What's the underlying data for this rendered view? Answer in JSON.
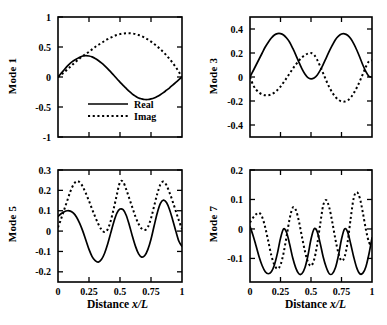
{
  "figure": {
    "background": "#ffffff",
    "ink": "#000000",
    "panel_count": 4
  },
  "legend": {
    "real_label": "Real",
    "imag_label": "Imag",
    "real_style": "solid",
    "imag_style": "dotted",
    "panel": "Mode 1"
  },
  "axes": {
    "xlabel_prefix": "Distance ",
    "xlabel_italic": "x/L",
    "xticks": [
      "0",
      "0.25",
      "0.5",
      "0.75",
      "1"
    ],
    "xtick_values": [
      0,
      0.25,
      0.5,
      0.75,
      1
    ]
  },
  "chart_data": [
    {
      "type": "line",
      "title": "Mode 1",
      "ylabel": "Mode 1",
      "xlabel": "",
      "xlim": [
        0,
        1
      ],
      "ylim": [
        -1,
        1
      ],
      "xticks": [
        0,
        0.25,
        0.5,
        0.75,
        1
      ],
      "xticklabels": [
        "",
        "",
        "",
        "",
        ""
      ],
      "yticks": [
        -1,
        -0.5,
        0,
        0.5,
        1
      ],
      "yticklabels": [
        "-1",
        "-0.5",
        "0",
        "0.5",
        "1"
      ],
      "grid": false,
      "legend": [
        "Real",
        "Imag"
      ],
      "legend_position": "lower center",
      "x": [
        0,
        0.025,
        0.05,
        0.075,
        0.1,
        0.125,
        0.15,
        0.175,
        0.2,
        0.225,
        0.25,
        0.275,
        0.3,
        0.325,
        0.35,
        0.375,
        0.4,
        0.425,
        0.45,
        0.475,
        0.5,
        0.525,
        0.55,
        0.575,
        0.6,
        0.625,
        0.65,
        0.675,
        0.7,
        0.725,
        0.75,
        0.775,
        0.8,
        0.825,
        0.85,
        0.875,
        0.9,
        0.925,
        0.95,
        0.975,
        1
      ],
      "series": [
        {
          "name": "Real",
          "style": "solid",
          "values": [
            0.0,
            0.06,
            0.12,
            0.18,
            0.23,
            0.27,
            0.3,
            0.33,
            0.35,
            0.355,
            0.35,
            0.335,
            0.31,
            0.275,
            0.235,
            0.19,
            0.14,
            0.085,
            0.03,
            -0.03,
            -0.085,
            -0.14,
            -0.19,
            -0.24,
            -0.285,
            -0.32,
            -0.35,
            -0.365,
            -0.375,
            -0.375,
            -0.365,
            -0.35,
            -0.325,
            -0.295,
            -0.26,
            -0.22,
            -0.18,
            -0.135,
            -0.09,
            -0.045,
            0.0
          ]
        },
        {
          "name": "Imag",
          "style": "dotted",
          "values": [
            0.0,
            0.04,
            0.08,
            0.125,
            0.17,
            0.22,
            0.265,
            0.31,
            0.35,
            0.385,
            0.42,
            0.46,
            0.5,
            0.535,
            0.565,
            0.6,
            0.63,
            0.655,
            0.68,
            0.7,
            0.715,
            0.725,
            0.73,
            0.73,
            0.725,
            0.715,
            0.7,
            0.68,
            0.655,
            0.625,
            0.59,
            0.55,
            0.51,
            0.465,
            0.415,
            0.36,
            0.3,
            0.235,
            0.165,
            0.085,
            0.0
          ]
        }
      ]
    },
    {
      "type": "line",
      "title": "Mode 3",
      "ylabel": "Mode 3",
      "xlabel": "",
      "xlim": [
        0,
        1
      ],
      "ylim": [
        -0.5,
        0.5
      ],
      "xticks": [
        0,
        0.25,
        0.5,
        0.75,
        1
      ],
      "xticklabels": [
        "",
        "",
        "",
        "",
        ""
      ],
      "yticks": [
        -0.4,
        -0.2,
        0,
        0.2,
        0.4
      ],
      "yticklabels": [
        "-0.4",
        "-0.2",
        "0",
        "0.2",
        "0.4"
      ],
      "grid": false,
      "legend": [],
      "x": [
        0,
        0.025,
        0.05,
        0.075,
        0.1,
        0.125,
        0.15,
        0.175,
        0.2,
        0.225,
        0.25,
        0.275,
        0.3,
        0.325,
        0.35,
        0.375,
        0.4,
        0.425,
        0.45,
        0.475,
        0.5,
        0.525,
        0.55,
        0.575,
        0.6,
        0.625,
        0.65,
        0.675,
        0.7,
        0.725,
        0.75,
        0.775,
        0.8,
        0.825,
        0.85,
        0.875,
        0.9,
        0.925,
        0.95,
        0.975,
        1
      ],
      "series": [
        {
          "name": "Real",
          "style": "solid",
          "values": [
            0.0,
            0.05,
            0.1,
            0.15,
            0.2,
            0.25,
            0.29,
            0.325,
            0.35,
            0.362,
            0.362,
            0.35,
            0.325,
            0.29,
            0.24,
            0.185,
            0.125,
            0.07,
            0.025,
            -0.005,
            -0.015,
            -0.008,
            0.015,
            0.055,
            0.105,
            0.16,
            0.215,
            0.265,
            0.31,
            0.34,
            0.358,
            0.36,
            0.348,
            0.32,
            0.278,
            0.225,
            0.165,
            0.1,
            0.045,
            0.005,
            0.0
          ]
        },
        {
          "name": "Imag",
          "style": "dotted",
          "values": [
            0.0,
            -0.065,
            -0.105,
            -0.13,
            -0.145,
            -0.152,
            -0.152,
            -0.145,
            -0.13,
            -0.108,
            -0.08,
            -0.045,
            -0.008,
            0.03,
            0.068,
            0.103,
            0.135,
            0.162,
            0.182,
            0.195,
            0.2,
            0.185,
            0.145,
            0.09,
            0.03,
            -0.03,
            -0.085,
            -0.13,
            -0.165,
            -0.19,
            -0.203,
            -0.205,
            -0.195,
            -0.172,
            -0.135,
            -0.09,
            -0.035,
            0.025,
            0.085,
            0.13,
            0.14
          ]
        }
      ]
    },
    {
      "type": "line",
      "title": "Mode 5",
      "ylabel": "Mode 5",
      "xlabel": "Distance x/L",
      "xlim": [
        0,
        1
      ],
      "ylim": [
        -0.25,
        0.3
      ],
      "xticks": [
        0,
        0.25,
        0.5,
        0.75,
        1
      ],
      "xticklabels": [
        "0",
        "0.25",
        "0.5",
        "0.75",
        "1"
      ],
      "yticks": [
        -0.2,
        -0.1,
        0,
        0.1,
        0.2,
        0.3
      ],
      "yticklabels": [
        "-0.2",
        "-0.1",
        "0",
        "0.1",
        "0.2",
        "0.3"
      ],
      "grid": false,
      "legend": [],
      "x": [
        0,
        0.025,
        0.05,
        0.075,
        0.1,
        0.125,
        0.15,
        0.175,
        0.2,
        0.225,
        0.25,
        0.275,
        0.3,
        0.325,
        0.35,
        0.375,
        0.4,
        0.425,
        0.45,
        0.475,
        0.5,
        0.525,
        0.55,
        0.575,
        0.6,
        0.625,
        0.65,
        0.675,
        0.7,
        0.725,
        0.75,
        0.775,
        0.8,
        0.825,
        0.85,
        0.875,
        0.9,
        0.925,
        0.95,
        0.975,
        1
      ],
      "series": [
        {
          "name": "Real",
          "style": "solid",
          "values": [
            0.072,
            0.085,
            0.095,
            0.1,
            0.098,
            0.088,
            0.068,
            0.038,
            0.0,
            -0.045,
            -0.09,
            -0.125,
            -0.145,
            -0.152,
            -0.14,
            -0.11,
            -0.065,
            -0.01,
            0.045,
            0.088,
            0.108,
            0.105,
            0.078,
            0.03,
            -0.025,
            -0.075,
            -0.112,
            -0.128,
            -0.12,
            -0.09,
            -0.04,
            0.025,
            0.088,
            0.135,
            0.152,
            0.14,
            0.105,
            0.055,
            0.0,
            -0.05,
            -0.075
          ]
        },
        {
          "name": "Imag",
          "style": "dotted",
          "values": [
            0.018,
            0.06,
            0.105,
            0.15,
            0.195,
            0.228,
            0.245,
            0.24,
            0.218,
            0.185,
            0.148,
            0.108,
            0.07,
            0.035,
            0.008,
            -0.005,
            0.008,
            0.05,
            0.112,
            0.18,
            0.24,
            0.242,
            0.205,
            0.16,
            0.115,
            0.07,
            0.035,
            0.012,
            0.005,
            0.02,
            0.062,
            0.122,
            0.182,
            0.228,
            0.243,
            0.225,
            0.188,
            0.145,
            0.098,
            0.052,
            0.01
          ]
        }
      ]
    },
    {
      "type": "line",
      "title": "Mode 7",
      "ylabel": "Mode 7",
      "xlabel": "Distance x/L",
      "xlim": [
        0,
        1
      ],
      "ylim": [
        -0.18,
        0.2
      ],
      "xticks": [
        0,
        0.25,
        0.5,
        0.75,
        1
      ],
      "xticklabels": [
        "0",
        "0.25",
        "0.5",
        "0.75",
        "1"
      ],
      "yticks": [
        -0.1,
        0,
        0.1,
        0.2
      ],
      "yticklabels": [
        "-0.1",
        "0",
        "0.1",
        "0.2"
      ],
      "grid": false,
      "legend": [],
      "x": [
        0,
        0.025,
        0.05,
        0.075,
        0.1,
        0.125,
        0.15,
        0.175,
        0.2,
        0.225,
        0.25,
        0.275,
        0.3,
        0.325,
        0.35,
        0.375,
        0.4,
        0.425,
        0.45,
        0.475,
        0.5,
        0.525,
        0.55,
        0.575,
        0.6,
        0.625,
        0.65,
        0.675,
        0.7,
        0.725,
        0.75,
        0.775,
        0.8,
        0.825,
        0.85,
        0.875,
        0.9,
        0.925,
        0.95,
        0.975,
        1
      ],
      "series": [
        {
          "name": "Real",
          "style": "solid",
          "values": [
            0.008,
            -0.022,
            -0.058,
            -0.095,
            -0.125,
            -0.145,
            -0.152,
            -0.145,
            -0.122,
            -0.082,
            -0.032,
            0.0,
            -0.012,
            -0.052,
            -0.098,
            -0.132,
            -0.152,
            -0.152,
            -0.132,
            -0.09,
            -0.035,
            0.0,
            -0.008,
            -0.048,
            -0.095,
            -0.13,
            -0.152,
            -0.152,
            -0.132,
            -0.09,
            -0.035,
            0.0,
            -0.01,
            -0.05,
            -0.095,
            -0.132,
            -0.152,
            -0.15,
            -0.128,
            -0.085,
            -0.03
          ]
        },
        {
          "name": "Imag",
          "style": "dotted",
          "values": [
            0.022,
            0.038,
            0.05,
            0.055,
            0.04,
            0.005,
            -0.042,
            -0.09,
            -0.122,
            -0.135,
            -0.122,
            -0.082,
            -0.025,
            0.035,
            0.072,
            0.065,
            0.028,
            -0.025,
            -0.075,
            -0.112,
            -0.125,
            -0.105,
            -0.055,
            0.015,
            0.08,
            0.098,
            0.072,
            0.022,
            -0.035,
            -0.082,
            -0.108,
            -0.095,
            -0.045,
            0.035,
            0.105,
            0.125,
            0.105,
            0.055,
            -0.002,
            -0.045,
            -0.058
          ]
        }
      ]
    }
  ]
}
